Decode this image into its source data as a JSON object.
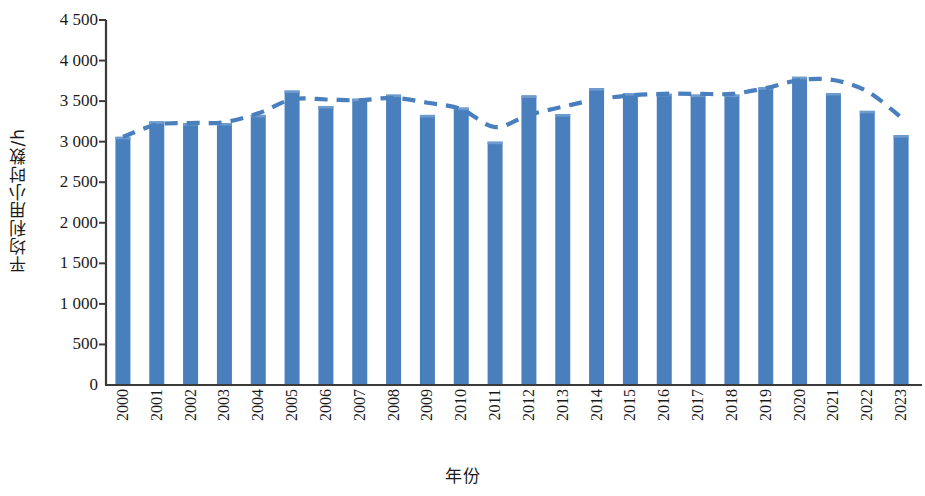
{
  "chart_data": {
    "type": "bar",
    "title": "",
    "subtitle": "",
    "xlabel": "年份",
    "ylabel": "平均利用小时数/h",
    "categories": [
      "2000",
      "2001",
      "2002",
      "2003",
      "2004",
      "2005",
      "2006",
      "2007",
      "2008",
      "2009",
      "2010",
      "2011",
      "2012",
      "2013",
      "2014",
      "2015",
      "2016",
      "2017",
      "2018",
      "2019",
      "2020",
      "2021",
      "2022",
      "2023"
    ],
    "values": [
      3060,
      3250,
      3230,
      3230,
      3330,
      3630,
      3440,
      3530,
      3580,
      3330,
      3420,
      3000,
      3570,
      3340,
      3660,
      3600,
      3590,
      3580,
      3580,
      3670,
      3800,
      3600,
      3380,
      3080
    ],
    "series": [
      {
        "name": "平均利用小时数",
        "type": "bar",
        "color": "#4a7fbe",
        "values": [
          3060,
          3250,
          3230,
          3230,
          3330,
          3630,
          3440,
          3530,
          3580,
          3330,
          3420,
          3000,
          3570,
          3340,
          3660,
          3600,
          3590,
          3580,
          3580,
          3670,
          3800,
          3600,
          3380,
          3080
        ]
      },
      {
        "name": "趋势线",
        "type": "line",
        "style": "dashed",
        "color": "#4a7fbe",
        "values": [
          3060,
          3210,
          3230,
          3240,
          3350,
          3520,
          3520,
          3510,
          3540,
          3480,
          3400,
          3180,
          3330,
          3430,
          3520,
          3570,
          3590,
          3590,
          3590,
          3660,
          3760,
          3760,
          3620,
          3300
        ]
      }
    ],
    "ylim": [
      0,
      4500
    ],
    "y_ticks": [
      "0",
      "500",
      "1 000",
      "1 500",
      "2 000",
      "2 500",
      "3 000",
      "3 500",
      "4 000",
      "4 500"
    ],
    "y_tick_values": [
      0,
      500,
      1000,
      1500,
      2000,
      2500,
      3000,
      3500,
      4000,
      4500
    ],
    "grid": false,
    "legend": "none",
    "axis_color": "#3a3a3a"
  }
}
